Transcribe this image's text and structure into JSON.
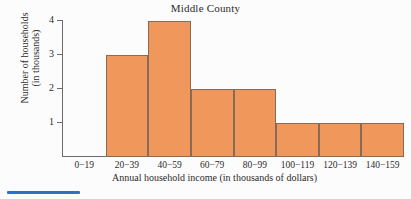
{
  "chart_data": {
    "type": "bar",
    "title": "Middle County",
    "xlabel": "Annual household income (in thousands of dollars)",
    "ylabel_line1": "Number of households",
    "ylabel_line2": "(in thousands)",
    "categories": [
      "0−19",
      "20−39",
      "40−59",
      "60−79",
      "80−99",
      "100−119",
      "120−139",
      "140−159"
    ],
    "values": [
      0,
      3,
      4,
      2,
      2,
      1,
      1,
      1
    ],
    "ylim": [
      0,
      4
    ],
    "yticks": [
      1,
      2,
      3,
      4
    ],
    "ytick_labels": [
      "1",
      "2",
      "3",
      "4"
    ],
    "grid": false,
    "legend": null,
    "bar_color": "#f0975c",
    "bar_edge_color": "#8a6a55",
    "axis_color": "#6b6b6b"
  },
  "annotations": {
    "blue_marker_color": "#2b72c4"
  }
}
